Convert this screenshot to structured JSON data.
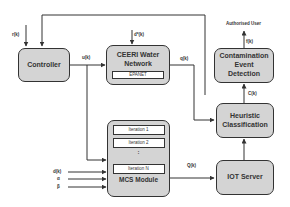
{
  "diagram": {
    "blocks": {
      "controller": "Controller",
      "water_network": {
        "title_line1": "CEERI Water",
        "title_line2": "Network",
        "sub": "EPANET"
      },
      "contamination": {
        "line1": "Contamination",
        "line2": "Event",
        "line3": "Detection"
      },
      "heuristic": {
        "line1": "Heuristic",
        "line2": "Classification"
      },
      "iot": "IOT Server",
      "mcs": {
        "title": "MCS Module",
        "iterations": [
          "Iteration 1",
          "Iteration 2",
          "Iteration N"
        ],
        "dots": ":"
      }
    },
    "signals": {
      "r_k": "r(k)",
      "u_k": "u(k)",
      "d_star_k": "d*(k)",
      "q_k": "q(k)",
      "f_k": "f(k)",
      "c_k": "C(k)",
      "q_hat_k": "Q(k)",
      "d_k": "d(k)",
      "alpha": "α",
      "beta": "β",
      "authorised_user": "Authorised User"
    },
    "colors": {
      "block_fill": "#d4d4d4",
      "line": "#333333"
    }
  }
}
